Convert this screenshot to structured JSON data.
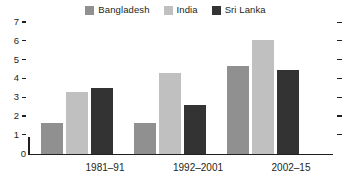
{
  "chart_data": {
    "type": "bar",
    "title": "",
    "subtitle": "",
    "xlabel": "",
    "ylabel": "",
    "categories": [
      "1981–91",
      "1992–2001",
      "2002–15"
    ],
    "series": [
      {
        "name": "Bangladesh",
        "color": "#909090",
        "values": [
          1.6,
          1.65,
          4.65
        ]
      },
      {
        "name": "India",
        "color": "#c0c0c0",
        "values": [
          3.3,
          4.3,
          6.05
        ]
      },
      {
        "name": "Sri Lanka",
        "color": "#333333",
        "values": [
          3.5,
          2.6,
          4.45
        ]
      }
    ],
    "ylim": [
      0,
      7
    ],
    "yticks": [
      0,
      1,
      2,
      3,
      4,
      5,
      6,
      7
    ],
    "ytick_labels": [
      "0",
      "1",
      "2",
      "3",
      "4",
      "5",
      "6",
      "7"
    ],
    "right_axis_ticks": [
      1,
      2,
      3,
      4,
      5,
      6,
      7
    ],
    "grid": false,
    "legend_position": "top-center"
  },
  "legend": {
    "items": [
      {
        "label": "Bangladesh",
        "color": "#909090"
      },
      {
        "label": "India",
        "color": "#c0c0c0"
      },
      {
        "label": "Sri Lanka",
        "color": "#333333"
      }
    ]
  },
  "axes": {
    "y_labels": [
      "7",
      "6",
      "5",
      "4",
      "3",
      "2",
      "1",
      "0"
    ],
    "x_labels": [
      "1981–91",
      "1992–2001",
      "2002–15"
    ]
  },
  "colors": {
    "bangladesh": "#909090",
    "india": "#c0c0c0",
    "sri_lanka": "#333333",
    "axis": "#231f20",
    "background": "#ffffff"
  }
}
